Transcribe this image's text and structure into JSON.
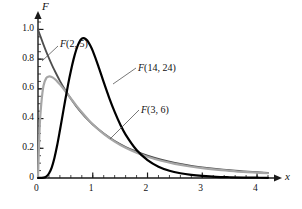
{
  "chart_data": {
    "type": "line",
    "title": "",
    "xlabel": "x",
    "ylabel": "F",
    "xlim": [
      0,
      4.2
    ],
    "ylim": [
      0,
      1.05
    ],
    "xticks": [
      0,
      1,
      2,
      3,
      4
    ],
    "xticklabels": [
      "0",
      "1",
      "2",
      "3",
      "4"
    ],
    "yticks": [
      0,
      0.2,
      0.4,
      0.6,
      0.8,
      1.0
    ],
    "yticklabels": [
      "0",
      "0.2",
      "0.4",
      "0.6",
      "0.8",
      "1.0"
    ],
    "minor_tick_step_x": 0.2,
    "minor_tick_step_y": 0.05,
    "grid": false,
    "legend": "inline-annotations",
    "series": [
      {
        "name": "F(2, 5)",
        "label": "F(2, 5)",
        "color": "#4d4d4d",
        "width": 1.8,
        "peak_x": 0.0,
        "peak_y": 1.0,
        "x": [
          0.0,
          0.05,
          0.1,
          0.15,
          0.2,
          0.25,
          0.3,
          0.4,
          0.5,
          0.6,
          0.7,
          0.8,
          0.9,
          1.0,
          1.2,
          1.4,
          1.6,
          1.8,
          2.0,
          2.25,
          2.5,
          2.75,
          3.0,
          3.25,
          3.5,
          3.75,
          4.0,
          4.2
        ],
        "y": [
          1.0,
          0.948,
          0.898,
          0.851,
          0.807,
          0.765,
          0.726,
          0.654,
          0.59,
          0.533,
          0.482,
          0.437,
          0.396,
          0.36,
          0.299,
          0.249,
          0.209,
          0.177,
          0.15,
          0.123,
          0.102,
          0.085,
          0.072,
          0.061,
          0.052,
          0.045,
          0.039,
          0.035
        ]
      },
      {
        "name": "F(3, 6)",
        "label": "F(3, 6)",
        "color": "#a6a6a6",
        "width": 2.2,
        "peak_x": 0.25,
        "peak_y": 0.68,
        "x": [
          0.0,
          0.03,
          0.06,
          0.1,
          0.15,
          0.2,
          0.25,
          0.3,
          0.35,
          0.4,
          0.5,
          0.6,
          0.7,
          0.8,
          0.9,
          1.0,
          1.2,
          1.4,
          1.6,
          1.8,
          2.0,
          2.25,
          2.5,
          2.75,
          3.0,
          3.25,
          3.5,
          3.75,
          4.0,
          4.2
        ],
        "y": [
          0.0,
          0.34,
          0.5,
          0.62,
          0.672,
          0.683,
          0.68,
          0.668,
          0.65,
          0.63,
          0.584,
          0.535,
          0.487,
          0.442,
          0.4,
          0.362,
          0.297,
          0.245,
          0.203,
          0.17,
          0.143,
          0.116,
          0.095,
          0.079,
          0.066,
          0.056,
          0.048,
          0.041,
          0.036,
          0.032
        ]
      },
      {
        "name": "F(14, 24)",
        "label": "F(14, 24)",
        "color": "#000000",
        "width": 2.2,
        "peak_x": 0.8,
        "peak_y": 0.94,
        "x": [
          0.0,
          0.1,
          0.15,
          0.2,
          0.25,
          0.3,
          0.35,
          0.4,
          0.45,
          0.5,
          0.55,
          0.6,
          0.65,
          0.7,
          0.75,
          0.8,
          0.85,
          0.9,
          0.95,
          1.0,
          1.1,
          1.2,
          1.3,
          1.4,
          1.5,
          1.6,
          1.8,
          2.0,
          2.2,
          2.4,
          2.6,
          2.8,
          3.0,
          3.25,
          3.5,
          3.75,
          4.0,
          4.2
        ],
        "y": [
          0.0,
          0.002,
          0.01,
          0.03,
          0.07,
          0.135,
          0.22,
          0.32,
          0.425,
          0.53,
          0.63,
          0.72,
          0.8,
          0.865,
          0.912,
          0.938,
          0.94,
          0.925,
          0.895,
          0.855,
          0.755,
          0.645,
          0.54,
          0.445,
          0.362,
          0.292,
          0.188,
          0.12,
          0.076,
          0.049,
          0.032,
          0.021,
          0.014,
          0.008,
          0.005,
          0.003,
          0.002,
          0.001
        ]
      }
    ],
    "annotations": [
      {
        "text": "F(2, 5)",
        "x_px": 60,
        "y_px": 38,
        "leader_from": [
          58,
          46
        ],
        "leader_to": [
          42,
          61
        ]
      },
      {
        "text": "F(14, 24)",
        "x_px": 138,
        "y_px": 62,
        "leader_from": [
          136,
          68
        ],
        "leader_to": [
          113,
          84
        ]
      },
      {
        "text": "F(3, 6)",
        "x_px": 141,
        "y_px": 104,
        "leader_from": [
          139,
          110
        ],
        "leader_to": [
          110,
          139
        ]
      }
    ]
  },
  "axis": {
    "y_label": "F",
    "x_label": "x"
  }
}
